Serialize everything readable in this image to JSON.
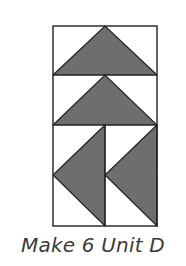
{
  "diagram": {
    "colors": {
      "fill": "#6e6e6e",
      "stroke": "#222222",
      "background": "#ffffff"
    },
    "units": [
      {
        "name": "flying-geese-up-1",
        "direction": "up",
        "row": 1
      },
      {
        "name": "flying-geese-up-2",
        "direction": "up",
        "row": 2
      },
      {
        "name": "flying-geese-left-1",
        "direction": "left",
        "column": 1
      },
      {
        "name": "flying-geese-left-2",
        "direction": "left",
        "column": 2
      }
    ]
  },
  "caption": {
    "text": "Make 6 Unit D"
  }
}
